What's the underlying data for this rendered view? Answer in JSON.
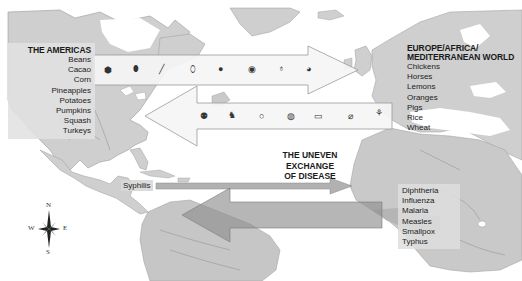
{
  "map": {
    "title": "The Uneven Exchange of Disease",
    "colors": {
      "land": "#c9c9c9",
      "land_dark": "#a9a9a9",
      "water": "#ffffff",
      "rivers": "#8a8a8a",
      "arrow_fill": "#f2f2f2",
      "arrow_stroke": "#9a9a9a",
      "disease_arrow": "#9c9c9c",
      "disease_arrow_dark": "#8a8a8a"
    },
    "americas": {
      "title": "THE AMERICAS",
      "items": [
        "Beans",
        "Cacao",
        "Corn",
        "Pineapples",
        "Potatoes",
        "Pumpkins",
        "Squash",
        "Turkeys"
      ]
    },
    "europe": {
      "title_line1": "EUROPE/AFRICA/",
      "title_line2": "MEDITERRANEAN WORLD",
      "items": [
        "Chickens",
        "Horses",
        "Lemons",
        "Oranges",
        "Pigs",
        "Rice",
        "Wheat"
      ]
    },
    "arrow_to_europe": {
      "icons": [
        "beans-icon",
        "cacao-icon",
        "corn-icon",
        "pineapple-icon",
        "potato-icon",
        "pumpkin-icon",
        "squash-icon",
        "turkey-icon"
      ]
    },
    "arrow_to_americas": {
      "icons": [
        "chicken-icon",
        "horse-icon",
        "lemon-icon",
        "orange-icon",
        "pig-icon",
        "rice-icon",
        "wheat-icon"
      ]
    },
    "disease": {
      "title_line1": "THE UNEVEN",
      "title_line2": "EXCHANGE",
      "title_line3": "OF DISEASE",
      "to_europe": "Syphilis",
      "to_americas": [
        "Diphtheria",
        "Influenza",
        "Malaria",
        "Measles",
        "Smallpox",
        "Typhus"
      ]
    },
    "compass": {
      "n": "N",
      "s": "S",
      "e": "E",
      "w": "W"
    }
  }
}
